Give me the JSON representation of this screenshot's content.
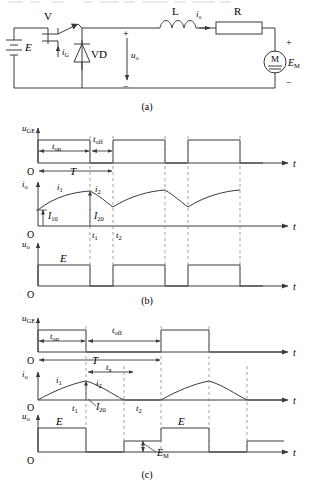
{
  "figure": {
    "caption_a": "(a)",
    "caption_b": "(b)",
    "caption_c": "(c)"
  },
  "circuit": {
    "source_label": "E",
    "switch_label": "V",
    "gate_current_label": "iG",
    "diode_label": "VD",
    "output_voltage_label": "uo",
    "inductor_label": "L",
    "output_current_label": "io",
    "resistor_label": "R",
    "motor_label": "M",
    "motor_emf_label": "EM",
    "plus_sign": "+",
    "minus_sign": "−"
  },
  "waveform_b": {
    "gate_axis_label": "uGE",
    "current_axis_label": "io",
    "voltage_axis_label": "uo",
    "origin_label": "O",
    "time_axis_label": "t",
    "t_on": "ton",
    "t_off": "toff",
    "period": "T",
    "i1": "i1",
    "i2": "i2",
    "I10": "I10",
    "I20": "I20",
    "t1": "t1",
    "t2": "t2",
    "E": "E"
  },
  "waveform_c": {
    "gate_axis_label": "uGE",
    "current_axis_label": "io",
    "voltage_axis_label": "uo",
    "origin_label": "O",
    "time_axis_label": "t",
    "t_on": "ton",
    "t_off": "toff",
    "period": "T",
    "tx": "tx",
    "i1": "i1",
    "i2": "i2",
    "I20": "I20",
    "t1": "t1",
    "t2": "t2",
    "E_first": "E",
    "E_second": "E",
    "EM": "EM"
  },
  "colors": {
    "line": "#3a3a3a",
    "text": "#111111",
    "dashed": "#8a8a8a"
  }
}
